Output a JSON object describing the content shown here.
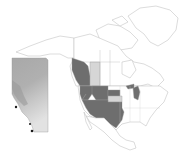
{
  "map": {
    "title": "",
    "region": "North America",
    "inset_region": "Alberta",
    "colors": {
      "background": "#ffffff",
      "land": "#ffffff",
      "border": "#b8b8b8",
      "highlight_dark": "#6e6e6e",
      "highlight_light": "#d6d6d6",
      "inset_dark": "#9a9a9a",
      "inset_mid": "#b5b5b5",
      "inset_light": "#dcdcdc",
      "inset_points": "#1a1a1a"
    },
    "highlighted_regions_dark": [
      "British Columbia",
      "Washington",
      "Idaho",
      "Montana",
      "Wyoming",
      "Nevada",
      "Utah",
      "Colorado",
      "Arizona",
      "New Mexico",
      "Kansas",
      "Oklahoma",
      "Texas",
      "South Dakota",
      "Michigan"
    ],
    "highlighted_regions_light": [
      "Alberta",
      "Nebraska"
    ],
    "inset_points_count": 3
  }
}
